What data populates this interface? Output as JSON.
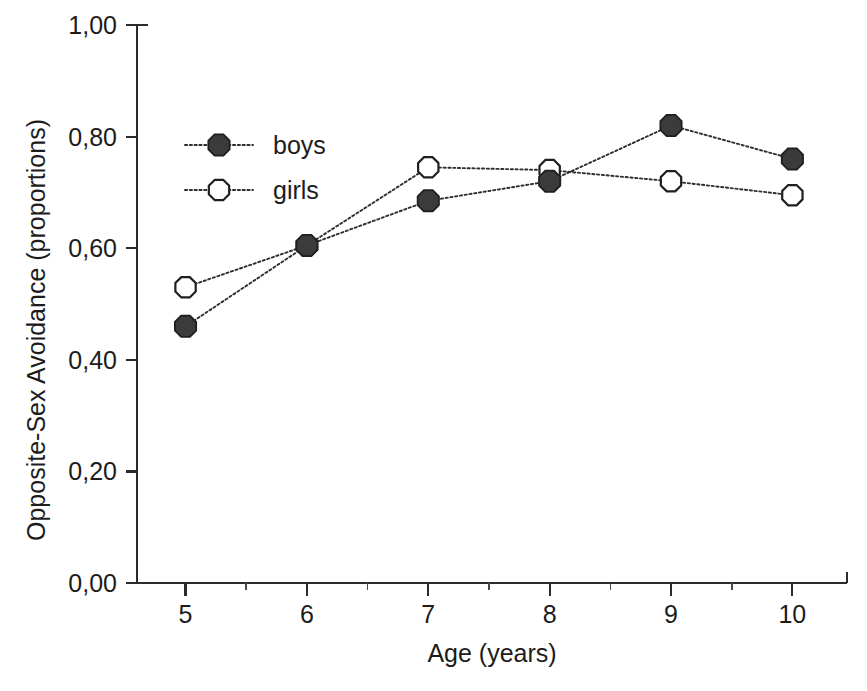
{
  "chart_data": {
    "type": "line",
    "title": "",
    "subtitle": "",
    "xlabel": "Age (years)",
    "ylabel": "Opposite-Sex Avoidance (proportions)",
    "x": [
      5,
      6,
      7,
      8,
      9,
      10
    ],
    "categories": [
      "5",
      "6",
      "7",
      "8",
      "9",
      "10"
    ],
    "xlim": [
      4.6,
      10.45
    ],
    "ylim": [
      0.0,
      1.0
    ],
    "grid": false,
    "legend_position": "upper-left-inside",
    "decimal_separator": ",",
    "xtick_labels": [
      "5",
      "6",
      "7",
      "8",
      "9",
      "10"
    ],
    "ytick_labels": [
      "0,00",
      "0,20",
      "0,40",
      "0,60",
      "0,80",
      "1,00"
    ],
    "ytick_values": [
      0.0,
      0.2,
      0.4,
      0.6,
      0.8,
      1.0
    ],
    "xtick_minor_step": 0.5,
    "series": [
      {
        "name": "boys",
        "marker": "filled-circle",
        "line_style": "dotted",
        "color": "#3b3b3b",
        "values": [
          0.46,
          0.605,
          0.685,
          0.72,
          0.82,
          0.76
        ]
      },
      {
        "name": "girls",
        "marker": "open-circle",
        "line_style": "dotted",
        "color": "#ffffff",
        "values": [
          0.53,
          0.605,
          0.745,
          0.74,
          0.72,
          0.695
        ]
      }
    ]
  },
  "legend": {
    "entries": [
      {
        "label": "boys"
      },
      {
        "label": "girls"
      }
    ]
  },
  "colors": {
    "background": "#ffffff",
    "axis": "#2b2b2b",
    "text": "#1c1c1c",
    "boys_marker_fill": "#3b3b3b",
    "girls_marker_fill": "#ffffff",
    "marker_stroke": "#1f1f1f",
    "line": "#2e2e2e"
  }
}
